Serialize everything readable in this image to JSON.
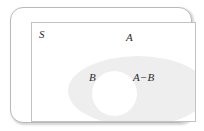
{
  "figure": {
    "type": "venn-diagram",
    "width": 204,
    "height": 131,
    "background_color": "#ffffff"
  },
  "universal_set": {
    "label": "S",
    "shape": "rounded-rectangle",
    "border_color": "#b9b9b9",
    "fill_color": "#ffffff"
  },
  "inner_frame": {
    "shape": "rectangle",
    "border_color": "#c2c2c2",
    "fill_color": "#ffffff"
  },
  "sets": [
    {
      "id": "A",
      "label": "A",
      "shape": "ellipse",
      "fill_color": "#eeeeee"
    },
    {
      "id": "B",
      "label": "B",
      "shape": "circle",
      "fill_color": "#ffffff"
    }
  ],
  "regions": [
    {
      "id": "A-minus-B",
      "label": "A−B",
      "fill_color": "#eeeeee"
    }
  ],
  "labels": {
    "universal": "S",
    "set_a": "A",
    "set_b": "B",
    "difference": "A−B"
  }
}
